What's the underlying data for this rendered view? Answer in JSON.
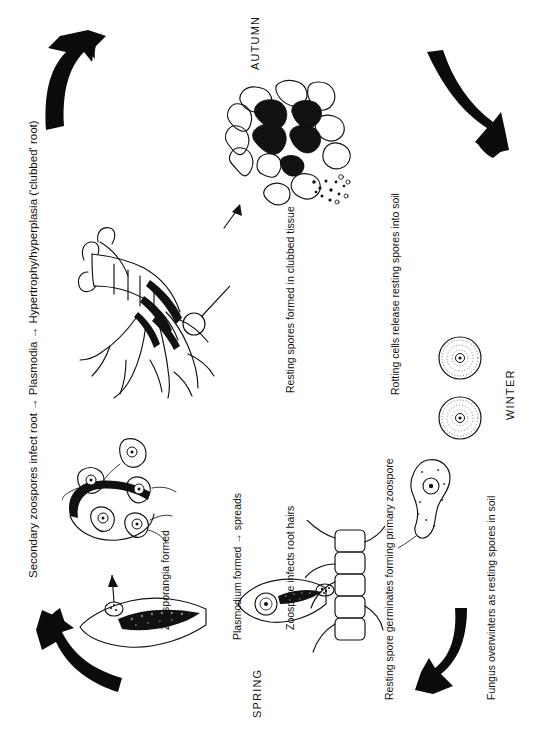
{
  "figure": {
    "orientation": "rotated-90-ccw",
    "ink_color": "#111111",
    "background_color": "#ffffff"
  },
  "seasons": [
    {
      "name": "autumn",
      "label": "AUTUMN"
    },
    {
      "name": "winter",
      "label": "WINTER"
    },
    {
      "name": "spring",
      "label": "SPRING"
    }
  ],
  "stages": [
    {
      "id": "secondary-infection",
      "label": "Secondary zoospores infect root  →  Plasmodia  →  Hypertrophy/hyperplasia ('clubbed' root)"
    },
    {
      "id": "resting-spores-formed",
      "label": "Resting spores formed in clubbed tissue"
    },
    {
      "id": "rotting-cells-release",
      "label": "Rotting cells release resting spores into soil"
    },
    {
      "id": "overwinter",
      "label": "Fungus overwinters as resting spores in soil"
    },
    {
      "id": "germination",
      "label": "Resting spore germinates forming primary zoospore"
    },
    {
      "id": "root-hair-infection",
      "label": "Zoospore infects root hairs"
    },
    {
      "id": "plasmodium",
      "label": "Plasmodium formed  →  spreads"
    },
    {
      "id": "zoosporangia",
      "label": "Zoosporangia formed"
    }
  ],
  "arrows": [
    {
      "id": "arrow-top-left",
      "direction": "curved-up-right",
      "name": "cycle-arrow-spring-to-summer"
    },
    {
      "id": "arrow-top-right",
      "direction": "curved-down-right",
      "name": "cycle-arrow-autumn-to-winter"
    },
    {
      "id": "arrow-bottom-right",
      "direction": "curved-down-left",
      "name": "cycle-arrow-winter-to-spring"
    },
    {
      "id": "arrow-bottom-left",
      "direction": "curved-up-left",
      "name": "cycle-arrow-spring-start"
    }
  ],
  "illustrations": [
    {
      "id": "clubbed-root",
      "name": "clubbed-root-drawing"
    },
    {
      "id": "clubbed-tissue-cells",
      "name": "clubbed-tissue-cells-drawing"
    },
    {
      "id": "resting-spores",
      "name": "resting-spores-drawing",
      "count": 2
    },
    {
      "id": "primary-zoospore",
      "name": "primary-zoospore-drawing"
    },
    {
      "id": "root-hairs",
      "name": "root-hair-cells-drawing"
    },
    {
      "id": "plasmodium-in-root",
      "name": "plasmodium-in-root-drawing"
    },
    {
      "id": "zoosporangium",
      "name": "zoosporangium-drawing"
    },
    {
      "id": "secondary-zoospores",
      "name": "secondary-zoospores-drawing"
    }
  ]
}
